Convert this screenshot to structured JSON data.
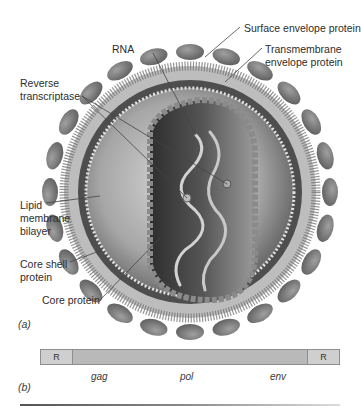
{
  "figure": {
    "panel_a": {
      "label": "(a)",
      "labels": {
        "surface_envelope_protein": "Surface envelope protein",
        "rna": "RNA",
        "transmembrane_line1": "Transmembrane",
        "transmembrane_line2": "envelope protein",
        "reverse_transcriptase_line1": "Reverse",
        "reverse_transcriptase_line2": "transcriptase",
        "lipid_line1": "Lipid",
        "lipid_line2": "membrane",
        "lipid_line3": "bilayer",
        "core_shell_line1": "Core shell",
        "core_shell_line2": "protein",
        "core_protein": "Core protein"
      }
    },
    "panel_b": {
      "label": "(b)",
      "ltr_left": "R",
      "ltr_right": "R",
      "genes": [
        "gag",
        "pol",
        "env"
      ]
    },
    "colors": {
      "envelope_protein": "#7a7a7a",
      "membrane": "#b0b0b0",
      "core": "#4a4a4a",
      "genome_bar": "#b9b9b9",
      "ltr_box": "#cfcfcf"
    }
  }
}
